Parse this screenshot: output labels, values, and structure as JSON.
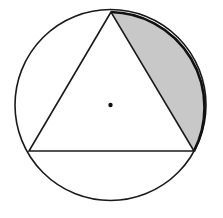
{
  "figure": {
    "circle": {
      "cx": 110.5,
      "cy": 105,
      "r": 95.5,
      "stroke": "#1a1a1a"
    },
    "center_dot": {
      "cx": 110.5,
      "cy": 105,
      "r": 2.2,
      "fill": "#111111"
    },
    "triangle": {
      "vertices": [
        {
          "label": "top",
          "x": 111,
          "y": 12
        },
        {
          "label": "bottom-left",
          "x": 29,
          "y": 151
        },
        {
          "label": "bottom-right",
          "x": 194,
          "y": 151
        }
      ],
      "stroke": "#1a1a1a"
    },
    "shaded_segment": {
      "between": [
        "top",
        "bottom-right"
      ],
      "fill": "#c8c8c8",
      "arc_stroke": "#111111"
    }
  }
}
